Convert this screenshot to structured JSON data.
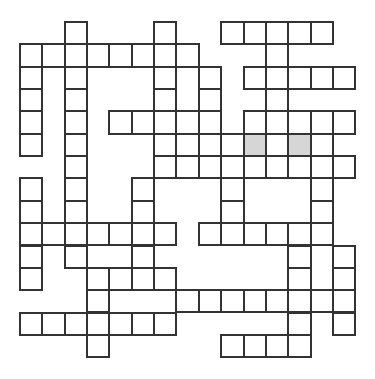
{
  "puzzle": {
    "type": "crossword",
    "rows": 15,
    "cols": 15,
    "origin": {
      "x": 20,
      "y": 22
    },
    "cell_size": 22.35,
    "colors": {
      "line": "#333333",
      "cell": "#ffffff",
      "shaded": "#d6d6d6",
      "background": "#ffffff"
    },
    "grid_rows": [
      {
        "row": 0,
        "cells": [
          2,
          6,
          9,
          10,
          11,
          12,
          13
        ]
      },
      {
        "row": 1,
        "cells": [
          0,
          1,
          2,
          3,
          4,
          5,
          6,
          7,
          11
        ]
      },
      {
        "row": 2,
        "cells": [
          0,
          2,
          6,
          8,
          10,
          11,
          12,
          13,
          14
        ]
      },
      {
        "row": 3,
        "cells": [
          0,
          2,
          6,
          8,
          11
        ]
      },
      {
        "row": 4,
        "cells": [
          0,
          2,
          4,
          5,
          6,
          7,
          8,
          10,
          11,
          12,
          13,
          14
        ]
      },
      {
        "row": 5,
        "cells": [
          0,
          2,
          6,
          8,
          9,
          10,
          11,
          12,
          13
        ]
      },
      {
        "row": 6,
        "cells": [
          2,
          6,
          7,
          8,
          9,
          10,
          11,
          12,
          13,
          14
        ]
      },
      {
        "row": 7,
        "cells": [
          0,
          2,
          5,
          9,
          13
        ]
      },
      {
        "row": 8,
        "cells": [
          0,
          2,
          5,
          9,
          13
        ]
      },
      {
        "row": 9,
        "cells": [
          0,
          1,
          2,
          3,
          4,
          5,
          6,
          8,
          9,
          10,
          11,
          12,
          13
        ]
      },
      {
        "row": 10,
        "cells": [
          0,
          2,
          5,
          12,
          14
        ]
      },
      {
        "row": 11,
        "cells": [
          0,
          3,
          4,
          5,
          6,
          12,
          14
        ]
      },
      {
        "row": 12,
        "cells": [
          3,
          7,
          8,
          9,
          10,
          11,
          12,
          13,
          14
        ]
      },
      {
        "row": 13,
        "cells": [
          0,
          1,
          2,
          3,
          4,
          5,
          6,
          12,
          14
        ]
      },
      {
        "row": 14,
        "cells": [
          3,
          9,
          10,
          11,
          12
        ]
      }
    ],
    "shaded_cells": [
      {
        "row": 5,
        "col": 10
      },
      {
        "row": 5,
        "col": 12
      }
    ],
    "entries": {}
  }
}
